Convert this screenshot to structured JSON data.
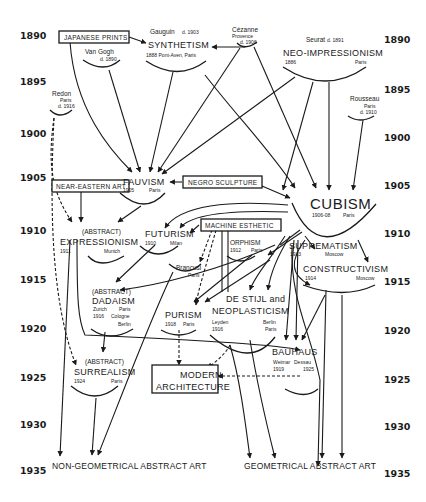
{
  "diagram": {
    "years_left": [
      "1890",
      "1895",
      "1900",
      "1905",
      "1910",
      "1915",
      "1920",
      "1925",
      "1930",
      "1935"
    ],
    "years_right": [
      "1890",
      "1895",
      "1900",
      "1905",
      "1910",
      "1915",
      "1920",
      "1925",
      "1930",
      "1935"
    ],
    "external_influences": {
      "japanese_prints": "JAPANESE PRINTS",
      "near_eastern_art": "NEAR-EASTERN ART",
      "negro_sculpture": "NEGRO SCULPTURE",
      "machine_esthetic": "MACHINE ESTHETIC",
      "modern_architecture_1": "MODERN",
      "modern_architecture_2": "ARCHITECTURE"
    },
    "artists": {
      "van_gogh": {
        "name": "Van Gogh",
        "note": "d. 1890"
      },
      "gauguin": {
        "name": "Gauguin",
        "note": "d. 1903"
      },
      "cezanne": {
        "name": "Cézanne",
        "place": "Provence",
        "note": "d. 1906"
      },
      "seurat": {
        "name": "Seurat",
        "note": "d. 1891"
      },
      "redon": {
        "name": "Redon",
        "place": "Paris",
        "note": "d. 1916"
      },
      "rousseau": {
        "name": "Rousseau",
        "place": "Paris",
        "note": "d. 1910"
      },
      "brancusi": {
        "name": "Brancusi",
        "place": "Paris"
      }
    },
    "movements": {
      "synthetism": {
        "name": "SYNTHETISM",
        "detail": "1888  Pont-Aven, Paris"
      },
      "neo_impressionism": {
        "name": "NEO-IMPRESSIONISM",
        "year": "1886",
        "place": "Paris"
      },
      "fauvism": {
        "name": "FAUVISM",
        "year": "1905",
        "place": "Paris"
      },
      "cubism": {
        "name": "CUBISM",
        "year": "1906-08",
        "place": "Paris"
      },
      "expressionism": {
        "prefix": "(ABSTRACT)",
        "name": "EXPRESSIONISM",
        "year": "1911",
        "place": "Munich"
      },
      "futurism": {
        "name": "FUTURISM",
        "year": "1910",
        "place": "Milan"
      },
      "orphism": {
        "name": "ORPHISM",
        "year": "1912",
        "place": "Paris"
      },
      "suprematism": {
        "name": "SUPREMATISM",
        "year": "1913",
        "place": "Moscow"
      },
      "constructivism": {
        "name": "CONSTRUCTIVISM",
        "year": "1914",
        "place": "Moscow"
      },
      "dadaism": {
        "prefix": "(ABSTRACT)",
        "name": "DADAISM",
        "place1": "Zurich",
        "place2": "Paris",
        "year": "1916",
        "place3": "Cologne",
        "place4": "Berlin"
      },
      "de_stijl": {
        "name1": "DE STIJL and",
        "name2": "NEOPLASTICISM",
        "place1": "Leyden",
        "year": "1916",
        "place2": "Berlin",
        "place3": "Paris"
      },
      "purism": {
        "name": "PURISM",
        "year": "1918",
        "place": "Paris"
      },
      "bauhaus": {
        "name": "BAUHAUS",
        "place1": "Weimar",
        "place2": "Dessau",
        "year1": "1919",
        "year2": "1925"
      },
      "surrealism": {
        "prefix": "(ABSTRACT)",
        "name": "SURREALISM",
        "year": "1924",
        "place": "Paris"
      }
    },
    "outcomes": {
      "non_geometrical": "NON-GEOMETRICAL ABSTRACT ART",
      "geometrical": "GEOMETRICAL ABSTRACT ART"
    }
  }
}
